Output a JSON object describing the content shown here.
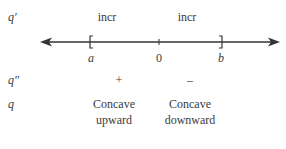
{
  "rows": {
    "first_derivative": {
      "label": "q′",
      "signs": [
        "incr",
        "incr"
      ]
    },
    "second_derivative": {
      "label": "q″",
      "signs": [
        "+",
        "–"
      ]
    },
    "function": {
      "label": "q",
      "concavity": [
        {
          "line1": "Concave",
          "line2": "upward"
        },
        {
          "line1": "Concave",
          "line2": "downward"
        }
      ]
    }
  },
  "number_line": {
    "left_bracket": "[",
    "right_bracket": "]",
    "points": [
      {
        "label": "a"
      },
      {
        "label": "0"
      },
      {
        "label": "b"
      }
    ]
  },
  "colors": {
    "line": "#333333",
    "text": "#3a3a3a"
  }
}
